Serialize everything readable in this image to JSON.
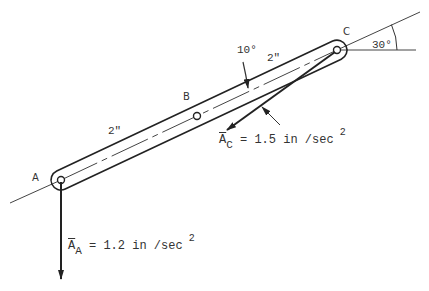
{
  "figure": {
    "points": {
      "A": "A",
      "B": "B",
      "C": "C"
    },
    "dimensions": {
      "AB": "2\"",
      "BC": "2\""
    },
    "angles": {
      "link_angle": "30°",
      "acc_angle": "10°"
    },
    "accelerations": {
      "A": {
        "symbol": "A",
        "subscript": "A",
        "equals": "= 1.2 in /sec",
        "exponent": "2"
      },
      "C": {
        "symbol": "A",
        "subscript": "C",
        "equals": "= 1.5 in /sec",
        "exponent": "2"
      }
    },
    "colors": {
      "line": "#222222",
      "text": "#333333",
      "background": "#ffffff"
    }
  }
}
